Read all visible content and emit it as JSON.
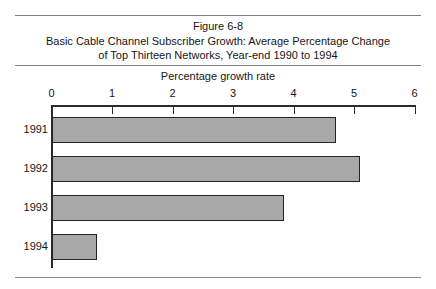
{
  "figure": {
    "title_lines": [
      "Figure 6-8",
      "Basic Cable Channel Subscriber Growth: Average Percentage Change",
      "of Top Thirteen Networks, Year-end 1990 to 1994"
    ]
  },
  "chart_data": {
    "type": "bar",
    "orientation": "horizontal",
    "xlabel": "Percentage growth rate",
    "ylabel": "",
    "categories": [
      "1991",
      "1992",
      "1993",
      "1994"
    ],
    "values": [
      4.7,
      5.1,
      3.85,
      0.75
    ],
    "xlim": [
      0,
      6
    ],
    "xticks": [
      0,
      1,
      2,
      3,
      4,
      5,
      6
    ],
    "xtick_labels": [
      "0",
      "1",
      "2",
      "3",
      "4",
      "5",
      "6"
    ],
    "grid": false,
    "legend": "none",
    "bar_color": "#a8a8a8",
    "bar_edge_color": "#242424",
    "axis_color": "#2b2b2b",
    "rule_color": "#808080"
  }
}
